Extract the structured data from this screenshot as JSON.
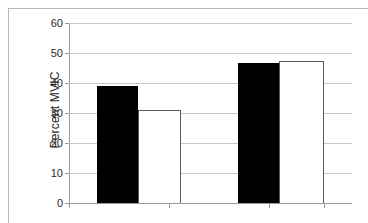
{
  "chart_data": {
    "type": "bar",
    "title": "",
    "subtitle": "",
    "xlabel": "",
    "ylabel": "Percent MVIC",
    "ylim": [
      0,
      60
    ],
    "ytick_labels": [
      "60",
      "50",
      "40",
      "30",
      "20",
      "10",
      "0"
    ],
    "ytick_values": [
      60,
      50,
      40,
      30,
      20,
      10,
      0
    ],
    "ytick_interval": 10,
    "grid": "horizontal",
    "legend": "none",
    "categories": [
      "Group 1",
      "Group 2"
    ],
    "series": [
      {
        "name": "Black",
        "fill": "#000000",
        "values": [
          39,
          46.7
        ]
      },
      {
        "name": "White",
        "fill": "#ffffff",
        "values": [
          31,
          47.3
        ]
      }
    ],
    "bars": [
      {
        "label": "Group 1 Black",
        "value": 39,
        "fill": "#000000",
        "edge": "#000000"
      },
      {
        "label": "Group 1 White",
        "value": 31,
        "fill": "#ffffff",
        "edge": "#5a5a5a"
      },
      {
        "label": "Group 2 Black",
        "value": 46.7,
        "fill": "#000000",
        "edge": "#000000"
      },
      {
        "label": "Group 2 White",
        "value": 47.3,
        "fill": "#ffffff",
        "edge": "#5a5a5a"
      }
    ]
  },
  "colors": {
    "grid": "#c6c6c6",
    "axis": "#9a9a9a",
    "frame": "#b9b9b9",
    "text": "#2b2b2b",
    "background": "#ffffff"
  }
}
